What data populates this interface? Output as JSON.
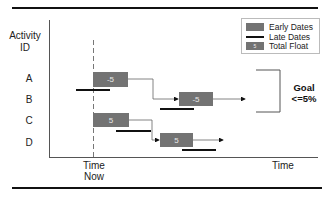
{
  "diagram": {
    "type": "gantt-schedule-float",
    "y_axis_label": "Activity\nID",
    "y_axis_label_lines": [
      "Activity",
      "ID"
    ],
    "x_axis_label": "Time",
    "time_now_label_lines": [
      "Time",
      "Now"
    ],
    "activities": [
      {
        "id": "A",
        "float": "-5"
      },
      {
        "id": "B",
        "float": "-5"
      },
      {
        "id": "C",
        "float": "5"
      },
      {
        "id": "D",
        "float": "5"
      }
    ],
    "legend": {
      "items": [
        {
          "label": "Early Dates",
          "swatch": "gray-box"
        },
        {
          "label": "Late Dates",
          "swatch": "black-line"
        },
        {
          "label": "Total Float",
          "swatch": "gray-box-number",
          "sample": "5"
        }
      ]
    },
    "goal": {
      "title": "Goal",
      "value": "<=5%"
    },
    "colors": {
      "bar": "#737373",
      "late_line": "#111111",
      "axis": "#555555",
      "connector": "#666666"
    }
  }
}
